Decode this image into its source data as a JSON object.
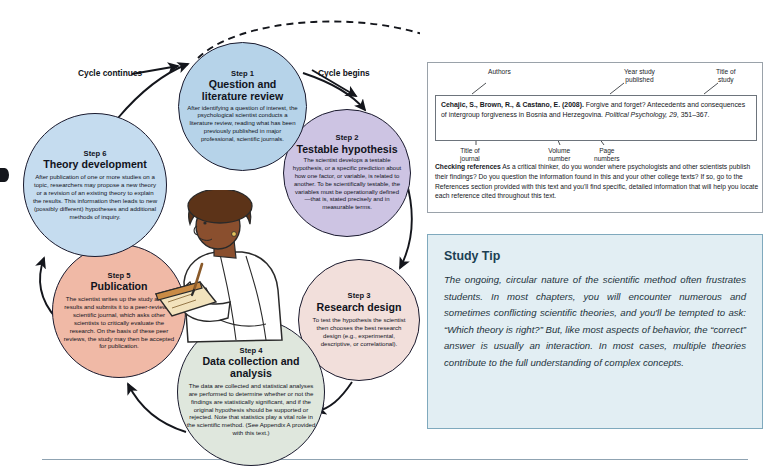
{
  "diagram": {
    "captions": {
      "cycle_continues": "Cycle continues",
      "cycle_begins": "Cycle begins"
    },
    "colors": {
      "step1": "#b6d3e9",
      "step2": "#cdc4e3",
      "step3": "#f2dfdb",
      "step4": "#dfe7dd",
      "step5": "#f0b9a6",
      "step6": "#c5dcef",
      "outline": "#1a1a2e",
      "tip_background": "#e2eef3",
      "tip_border": "#7fa9bd",
      "tip_title": "#1c3f52"
    },
    "steps": [
      {
        "label": "Step 1",
        "title": "Question and literature review",
        "body": "After identifying a question of interest, the psychological scientist conducts a literature review, reading what has been previously published in major professional, scientific journals."
      },
      {
        "label": "Step 2",
        "title": "Testable hypothesis",
        "body": "The scientist develops a testable hypothesis, or a specific prediction about how one factor, or variable, is related to another. To be scientifically testable, the variables must be operationally defined—that is, stated precisely and in measurable terms."
      },
      {
        "label": "Step 3",
        "title": "Research design",
        "body": "To test the hypothesis the scientist then chooses the best research design (e.g., experimental, descriptive, or correlational)."
      },
      {
        "label": "Step 4",
        "title": "Data collection and analysis",
        "body": "The data are collected and statistical analyses are performed to determine whether or not the findings are statistically significant, and if the original hypothesis should be supported or rejected. Note that statistics play a vital role in the scientific method. (See Appendix A provided with this text.)"
      },
      {
        "label": "Step 5",
        "title": "Publication",
        "body": "The scientist writes up the study and its results and submits it to a peer-reviewed scientific journal, which asks other scientists to critically evaluate the research. On the basis of these peer reviews, the study may then be accepted for publication."
      },
      {
        "label": "Step 6",
        "title": "Theory development",
        "body": "After publication of one or more studies on a topic, researchers may propose a new theory or a revision of an existing theory to explain the results. This information then leads to new (possibly different) hypotheses and additional methods of inquiry."
      }
    ]
  },
  "reference_panel": {
    "annotations": {
      "authors": "Authors",
      "year": "Year study\npublished",
      "title_of_study": "Title of\nstudy",
      "title_of_journal": "Title of\njournal",
      "volume_number": "Volume\nnumber",
      "page_numbers": "Page\nnumbers"
    },
    "citation": {
      "authors": "Cehajic, S., Brown, R., & Castano, E.",
      "year": "(2008).",
      "study_title": "Forgive and forget? Antecedents and consequences of intergroup forgiveness in Bosnia and Herzegovina.",
      "journal": "Political Psychology,",
      "volume": "29",
      "pages": ", 351–367."
    },
    "checking": {
      "heading": "Checking references",
      "body": "As a critical thinker, do you wonder where psychologists and other scientists publish their findings? Do you question the information found in this and your other college texts? If so, go to the References section provided with this text and you'll find specific, detailed information that will help you locate each reference cited throughout this text."
    }
  },
  "study_tip": {
    "title": "Study Tip",
    "body": "The ongoing, circular nature of the scientific method often frustrates students. In most chapters, you will encounter numerous and sometimes conflicting scientific theories, and you'll be tempted to ask: “Which theory is right?” But, like most aspects of behavior, the “correct” answer is usually an interaction. In most cases, multiple theories contribute to the full understanding of complex concepts."
  }
}
